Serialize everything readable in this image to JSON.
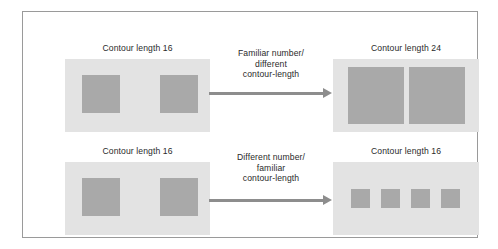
{
  "figure": {
    "border_color": "#9a9a9a",
    "background": "#ffffff",
    "panel_color": "#e3e3e3",
    "square_color": "#a9a9a9",
    "arrow_color": "#8d8d8d",
    "text_color": "#2a2a2a"
  },
  "rows": [
    {
      "left_label": "Contour length 16",
      "right_label": "Contour length 24",
      "arrow_caption_lines": [
        "Familiar number/",
        "different",
        "contour-length"
      ],
      "left_squares": 2,
      "right_squares": 2
    },
    {
      "left_label": "Contour length 16",
      "right_label": "Contour length 16",
      "arrow_caption_lines": [
        "Different number/",
        "familiar",
        "contour-length"
      ],
      "left_squares": 2,
      "right_squares": 4
    }
  ],
  "labels": {
    "top_left": "Contour length 16",
    "top_right": "Contour length 24",
    "bottom_left": "Contour length 16",
    "bottom_right": "Contour length 16"
  },
  "captions": {
    "top_line1": "Familiar number/",
    "top_line2": "different",
    "top_line3": "contour-length",
    "bottom_line1": "Different number/",
    "bottom_line2": "familiar",
    "bottom_line3": "contour-length"
  }
}
